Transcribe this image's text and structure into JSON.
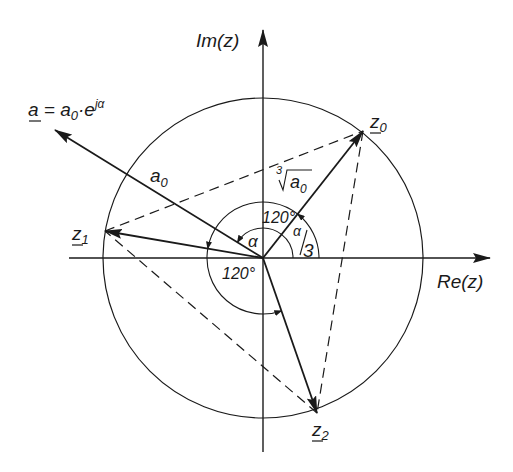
{
  "diagram": {
    "colors": {
      "line": "#1a1a1a",
      "background": "#ffffff"
    },
    "axes": {
      "re_label": "Re(z)",
      "im_label": "Im(z)"
    },
    "vectors": {
      "a_label": "a = a0·e^jα",
      "a_text_main": "a",
      "a_text_eq": " = a",
      "a_text_sub": "0",
      "a_text_dot": "·e",
      "a_text_sup": "jα",
      "a0_main": "a",
      "a0_sub": "0",
      "root_index": "3",
      "root_main": "a",
      "root_sub": "0"
    },
    "points": {
      "z0_main": "z",
      "z0_sub": "0",
      "z1_main": "z",
      "z1_sub": "1",
      "z2_main": "z",
      "z2_sub": "2"
    },
    "angles": {
      "alpha": "α",
      "alpha_third_num": "α",
      "alpha_third_den": "3",
      "angle_upper": "120°",
      "angle_lower": "120°"
    }
  }
}
